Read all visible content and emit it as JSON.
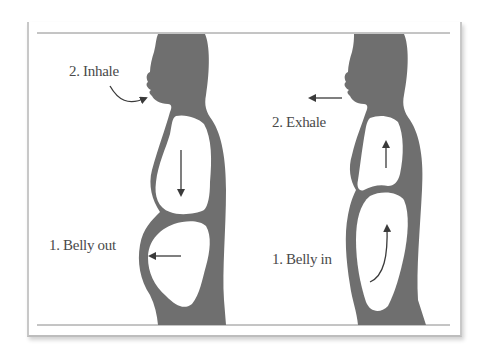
{
  "diagram": {
    "title": "",
    "colors": {
      "silhouette": "#6f6f6f",
      "background": "#ffffff",
      "text": "#4a4a4a",
      "arrow": "#3a3a3a",
      "rule": "#8a8a8a"
    },
    "panels": [
      {
        "id": "inhale",
        "labels": {
          "step2": "2. Inhale",
          "step1": "1. Belly out"
        },
        "arrows": [
          {
            "name": "inhale-arrow",
            "direction": "into-mouth"
          },
          {
            "name": "chest-arrow",
            "direction": "down"
          },
          {
            "name": "belly-arrow",
            "direction": "left"
          }
        ]
      },
      {
        "id": "exhale",
        "labels": {
          "step2": "2. Exhale",
          "step1": "1. Belly in"
        },
        "arrows": [
          {
            "name": "exhale-arrow",
            "direction": "left-from-mouth"
          },
          {
            "name": "chest-arrow",
            "direction": "up"
          },
          {
            "name": "belly-arrow",
            "direction": "up-curved"
          }
        ]
      }
    ]
  }
}
